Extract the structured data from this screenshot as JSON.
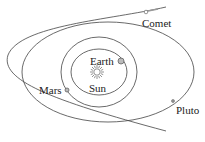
{
  "diagram": {
    "colors": {
      "orbit_line": "#444444",
      "label": "#222222",
      "sun": "#666666",
      "planet_fill": "#bbbbbb",
      "background": "#ffffff"
    },
    "labels": {
      "sun": "Sun",
      "earth": "Earth",
      "mars": "Mars",
      "pluto": "Pluto",
      "comet": "Comet"
    },
    "orbits": [
      {
        "name": "earth-orbit",
        "shape": "ellipse"
      },
      {
        "name": "mars-orbit",
        "shape": "ellipse"
      },
      {
        "name": "pluto-orbit",
        "shape": "ellipse"
      },
      {
        "name": "comet-path",
        "shape": "open curve"
      }
    ]
  }
}
